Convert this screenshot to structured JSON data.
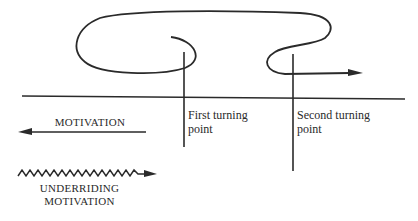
{
  "diagram": {
    "turning_points": [
      {
        "label": "First turning point",
        "line1": "First turning",
        "line2": "point"
      },
      {
        "label": "Second turning point",
        "line1": "Second turning",
        "line2": "point"
      }
    ],
    "legend": {
      "motivation": "MOTIVATION",
      "underriding_line1": "UNDERRIDING",
      "underriding_line2": "MOTIVATION"
    },
    "colors": {
      "line": "#2a2a2a",
      "background": "#ffffff"
    }
  }
}
